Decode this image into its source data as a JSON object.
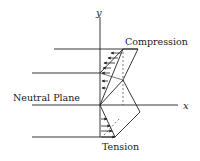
{
  "diagram": {
    "labels": {
      "y_axis": "y",
      "x_axis": "x",
      "compression": "Compression",
      "neutral_plane": "Neutral Plane",
      "tension": "Tension"
    },
    "colors": {
      "line": "#222222",
      "background": "#ffffff"
    }
  }
}
